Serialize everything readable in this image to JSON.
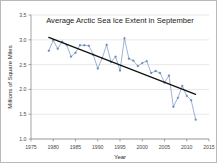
{
  "figure": {
    "frame_color": "#b9b9b9",
    "background": "#ffffff"
  },
  "chart_data": {
    "type": "line",
    "title": "Average Arctic Sea Ice Extent in September",
    "xlabel": "Year",
    "ylabel": "Millions of Square Miles",
    "xlim": [
      1975,
      2015
    ],
    "ylim": [
      1.0,
      3.5
    ],
    "xticks": [
      1975,
      1980,
      1985,
      1990,
      1995,
      2000,
      2005,
      2010,
      2015
    ],
    "yticks": [
      1.0,
      1.5,
      2.0,
      2.5,
      3.0,
      3.5
    ],
    "xtick_labels": [
      "1975",
      "1980",
      "1985",
      "1990",
      "1995",
      "2000",
      "2005",
      "2010",
      "2015"
    ],
    "ytick_labels": [
      "1.0",
      "1.5",
      "2.0",
      "2.5",
      "3.0",
      "3.5"
    ],
    "grid": true,
    "legend": "none",
    "series": [
      {
        "name": "September Arctic sea ice extent",
        "color": "#7b9bc4",
        "marker": true,
        "x": [
          1979,
          1980,
          1981,
          1982,
          1983,
          1984,
          1985,
          1986,
          1987,
          1988,
          1989,
          1990,
          1991,
          1992,
          1993,
          1994,
          1995,
          1996,
          1997,
          1998,
          1999,
          2000,
          2001,
          2002,
          2003,
          2004,
          2005,
          2006,
          2007,
          2008,
          2009,
          2010,
          2011,
          2012
        ],
        "values": [
          2.78,
          2.99,
          2.82,
          2.96,
          2.9,
          2.66,
          2.74,
          2.89,
          2.89,
          2.88,
          2.7,
          2.42,
          2.63,
          2.9,
          2.55,
          2.66,
          2.38,
          3.03,
          2.62,
          2.58,
          2.47,
          2.53,
          2.57,
          2.33,
          2.37,
          2.33,
          2.14,
          2.28,
          1.65,
          1.83,
          2.07,
          1.87,
          1.78,
          1.39
        ]
      },
      {
        "name": "Linear trend",
        "color": "#111111",
        "marker": false,
        "x": [
          1979,
          2012
        ],
        "values": [
          3.05,
          1.9
        ]
      }
    ]
  }
}
